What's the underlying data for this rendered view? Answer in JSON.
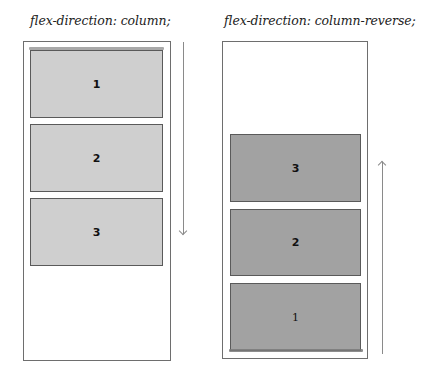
{
  "panels": [
    {
      "label": "flex-direction: column;",
      "direction": "down",
      "items": [
        {
          "label": "1"
        },
        {
          "label": "2"
        },
        {
          "label": "3"
        }
      ],
      "item_color": "#cfcfcf"
    },
    {
      "label": "flex-direction: column-reverse;",
      "direction": "up",
      "items": [
        {
          "label": "3"
        },
        {
          "label": "2"
        },
        {
          "label": "1"
        }
      ],
      "item_color": "#a2a2a2"
    }
  ]
}
